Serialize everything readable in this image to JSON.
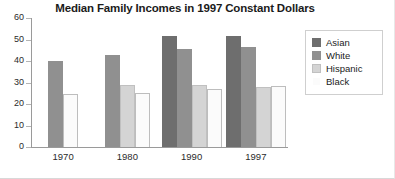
{
  "chart_data": {
    "type": "bar",
    "title": "Median Family Incomes in 1997 Constant Dollars",
    "xlabel": "",
    "ylabel": "",
    "ylim": [
      0,
      60
    ],
    "yticks": [
      0,
      10,
      20,
      30,
      40,
      50,
      60
    ],
    "ytick_labels": [
      "0",
      "10",
      "20",
      "30",
      "40",
      "50",
      "60"
    ],
    "grid": false,
    "legend_position": "right",
    "categories": [
      "1970",
      "1980",
      "1990",
      "1997"
    ],
    "series": [
      {
        "name": "Asian",
        "color": "#6e6e6e",
        "border": "#6e6e6e",
        "values": [
          null,
          null,
          51.5,
          51.5
        ]
      },
      {
        "name": "White",
        "color": "#909090",
        "border": "#909090",
        "values": [
          40,
          43,
          45.5,
          46.5
        ]
      },
      {
        "name": "Hispanic",
        "color": "#d4d4d4",
        "border": "#c0c0c0",
        "values": [
          null,
          29,
          29,
          28
        ]
      },
      {
        "name": "Black",
        "color": "#fbfbfb",
        "border": "#bdbdbd",
        "values": [
          24.5,
          25,
          27,
          28.5
        ]
      }
    ]
  }
}
